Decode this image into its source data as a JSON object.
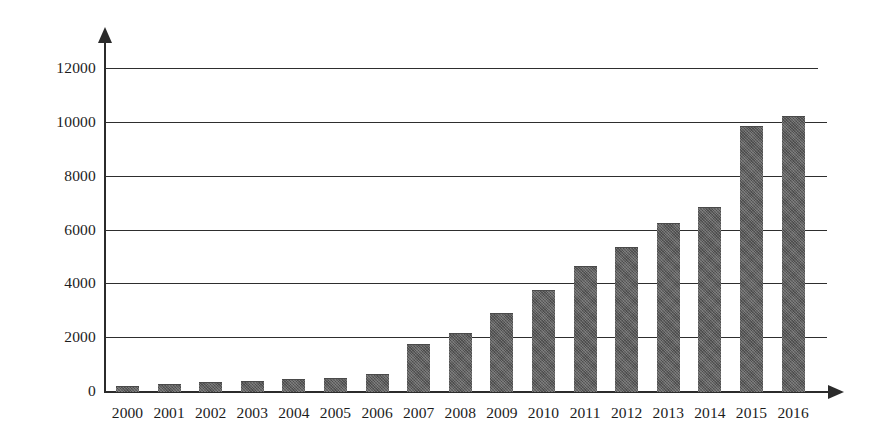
{
  "chart_data": {
    "type": "bar",
    "title": "",
    "subtitle": "",
    "xlabel": "",
    "ylabel": "",
    "categories": [
      "2000",
      "2001",
      "2002",
      "2003",
      "2004",
      "2005",
      "2006",
      "2007",
      "2008",
      "2009",
      "2010",
      "2011",
      "2012",
      "2013",
      "2014",
      "2015",
      "2016"
    ],
    "values": [
      200,
      250,
      330,
      370,
      430,
      500,
      640,
      1750,
      2150,
      2880,
      3750,
      4650,
      5350,
      6250,
      6850,
      9850,
      10200
    ],
    "series": [
      {
        "name": "",
        "values": [
          200,
          250,
          330,
          370,
          430,
          500,
          640,
          1750,
          2150,
          2880,
          3750,
          4650,
          5350,
          6250,
          6850,
          9850,
          10200
        ]
      }
    ],
    "ylim": [
      0,
      12000
    ],
    "yticks": [
      0,
      2000,
      4000,
      6000,
      8000,
      10000,
      12000
    ],
    "ytick_labels": [
      "0",
      "2000",
      "4000",
      "6000",
      "8000",
      "10000",
      "12000"
    ],
    "grid": true,
    "grid_axis": "y",
    "legend": false,
    "legend_position": "none",
    "bar_color": "#5b5b5b",
    "axis_color": "#2b2b2b",
    "background_color": "#ffffff",
    "annotations": []
  }
}
